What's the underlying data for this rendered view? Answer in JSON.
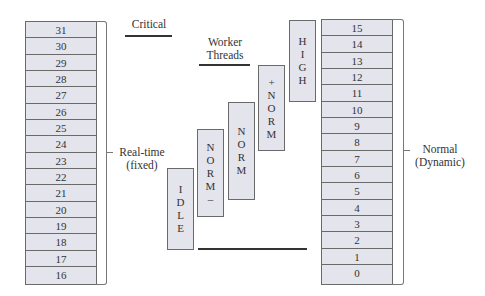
{
  "diagram": {
    "realtime_levels": [
      "31",
      "30",
      "29",
      "28",
      "27",
      "26",
      "25",
      "24",
      "23",
      "22",
      "21",
      "20",
      "19",
      "18",
      "17",
      "16"
    ],
    "normal_levels": [
      "15",
      "14",
      "13",
      "12",
      "11",
      "10",
      "9",
      "8",
      "7",
      "6",
      "5",
      "4",
      "3",
      "2",
      "1",
      "0"
    ],
    "realtime_label": {
      "line1": "Real-time",
      "line2": "(fixed)"
    },
    "normal_label": {
      "line1": "Normal",
      "line2": "(Dynamic)"
    },
    "critical_label": "Critical",
    "worker_label": {
      "line1": "Worker",
      "line2": "Threads"
    },
    "thread_priorities": [
      {
        "name": "IDLE",
        "letters": [
          "I",
          "D",
          "L",
          "E"
        ]
      },
      {
        "name": "NORM-",
        "letters": [
          "N",
          "O",
          "R",
          "M",
          "–"
        ]
      },
      {
        "name": "NORM",
        "letters": [
          "N",
          "O",
          "R",
          "M"
        ]
      },
      {
        "name": "+NORM",
        "letters": [
          "+",
          "N",
          "O",
          "R",
          "M"
        ]
      },
      {
        "name": "HIGH",
        "letters": [
          "H",
          "I",
          "G",
          "H"
        ]
      }
    ]
  }
}
